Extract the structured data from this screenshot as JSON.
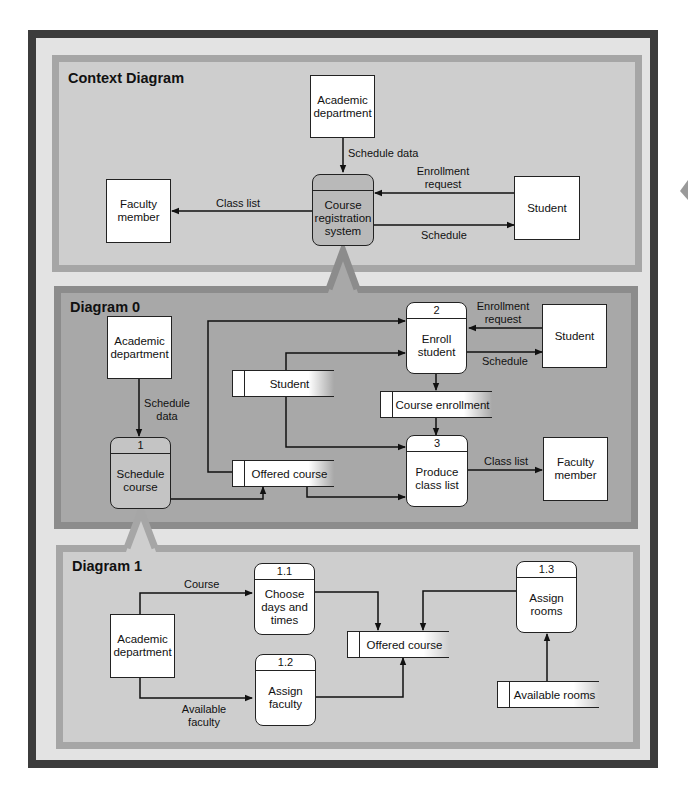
{
  "colors": {
    "frame": "#3c3c3c",
    "background": "#e3e3e3",
    "light_panel_fill": "#cecece",
    "light_panel_border": "#a6a6a6",
    "dark_panel_fill": "#a8a8a8",
    "dark_panel_border": "#8c8c8c",
    "shaded_process": "#b9b9b9"
  },
  "context_diagram": {
    "title": "Context Diagram",
    "entities": {
      "academic_department": "Academic department",
      "faculty_member": "Faculty member",
      "student": "Student"
    },
    "process": {
      "id": "",
      "name": "Course registration system"
    },
    "flows": {
      "schedule_data": "Schedule data",
      "enrollment_request": "Enrollment request",
      "class_list": "Class list",
      "schedule": "Schedule"
    }
  },
  "diagram_0": {
    "title": "Diagram 0",
    "entities": {
      "academic_department": "Academic department",
      "student": "Student",
      "faculty_member": "Faculty member"
    },
    "processes": [
      {
        "id": "1",
        "name": "Schedule course"
      },
      {
        "id": "2",
        "name": "Enroll student"
      },
      {
        "id": "3",
        "name": "Produce class list"
      }
    ],
    "stores": {
      "student": "Student",
      "offered_course": "Offered course",
      "course_enrollment": "Course enrollment"
    },
    "flows": {
      "schedule_data": "Schedule data",
      "enrollment_request": "Enrollment request",
      "schedule": "Schedule",
      "class_list": "Class list"
    }
  },
  "diagram_1": {
    "title": "Diagram 1",
    "entities": {
      "academic_department": "Academic department"
    },
    "processes": [
      {
        "id": "1.1",
        "name": "Choose days and times"
      },
      {
        "id": "1.2",
        "name": "Assign faculty"
      },
      {
        "id": "1.3",
        "name": "Assign rooms"
      }
    ],
    "stores": {
      "offered_course": "Offered course",
      "available_rooms": "Available rooms"
    },
    "flows": {
      "course": "Course",
      "available_faculty": "Available faculty"
    }
  }
}
